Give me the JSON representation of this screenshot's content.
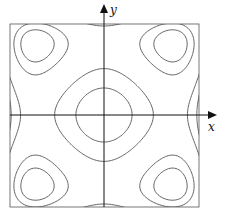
{
  "figure": {
    "axes": {
      "x_label": "x",
      "y_label": "y",
      "origin_px": [
        104,
        115
      ],
      "arrow_color": "#111111"
    },
    "frame": {
      "left": 10,
      "top": 24,
      "right": 199,
      "bottom": 207,
      "color": "#555555"
    },
    "curve_color": "#555555",
    "model": {
      "formula": "f(u,v) = u^2 - c*u^4 + v^2 - d*v^4",
      "c": 0.96,
      "d": 0.84,
      "u_scale_px": 95,
      "v_scale_px": 92,
      "levels": [
        0.08,
        0.2,
        0.42,
        0.5,
        0.62,
        0.7,
        0.82,
        0.98,
        -0.05,
        -0.2,
        -0.45,
        -0.75
      ]
    }
  }
}
